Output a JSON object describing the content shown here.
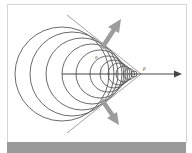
{
  "diagram": {
    "labels": {
      "angle": "θ",
      "velocity": "β"
    },
    "colors": {
      "circles": "#5a5a5a",
      "axis": "#444444",
      "tangent": "#8a8a8a",
      "emission_arrows": "#9c9c9c",
      "caption_bar": "#9a9a9a",
      "frame_border": "#d6d6d6"
    },
    "wavefront_circles": [
      {
        "cx": 62,
        "r": 47
      },
      {
        "cx": 72,
        "r": 42
      },
      {
        "cx": 82,
        "r": 36
      },
      {
        "cx": 92,
        "r": 30
      },
      {
        "cx": 100,
        "r": 24
      },
      {
        "cx": 108,
        "r": 18
      },
      {
        "cx": 114,
        "r": 14
      },
      {
        "cx": 119,
        "r": 11
      },
      {
        "cx": 124,
        "r": 8
      },
      {
        "cx": 129,
        "r": 5.5
      },
      {
        "cx": 134,
        "r": 3
      }
    ],
    "apex": {
      "x": 141,
      "y": 74
    },
    "axis_y": 74
  }
}
